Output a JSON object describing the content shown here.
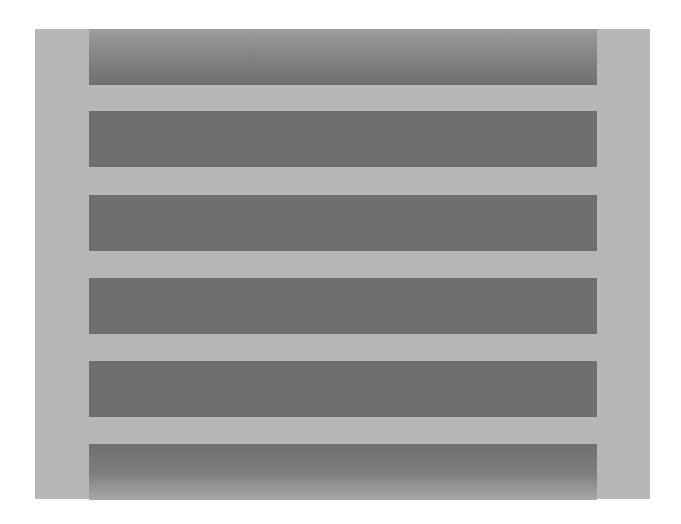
{
  "figure": {
    "panel_color": "#b6b6b6",
    "bar_color": "#6f6f6f",
    "bar_count": 6,
    "bars": [
      {
        "label": "bar-1",
        "top": 0,
        "style": "fade-top"
      },
      {
        "label": "bar-2",
        "top": 82,
        "style": "solid"
      },
      {
        "label": "bar-3",
        "top": 166,
        "style": "solid"
      },
      {
        "label": "bar-4",
        "top": 249,
        "style": "solid"
      },
      {
        "label": "bar-5",
        "top": 332,
        "style": "solid"
      },
      {
        "label": "bar-6",
        "top": 415,
        "style": "fade-bottom"
      }
    ]
  },
  "caption": {
    "text": ""
  }
}
